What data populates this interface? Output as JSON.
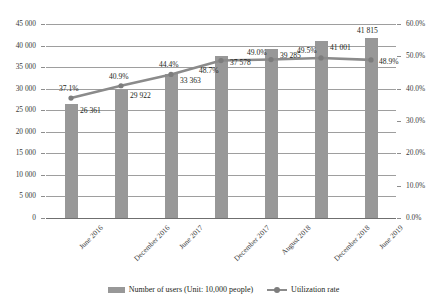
{
  "chart_data": {
    "type": "bar",
    "title": "",
    "subtitle": "",
    "xlabel": "",
    "ylabel": "",
    "grid": true,
    "legend_position": "bottom",
    "categories": [
      "June 2016",
      "December 2016",
      "June 2017",
      "December 2017",
      "August 2018",
      "December 2018",
      "June 2019"
    ],
    "series": [
      {
        "name": "Number of users (Unit: 10,000 people)",
        "type": "bar",
        "axis": "left",
        "color": "#989898",
        "values": [
          26361,
          29922,
          33363,
          37578,
          39285,
          41001,
          41815
        ],
        "value_labels": [
          "26 361",
          "29 922",
          "33 363",
          "37 578",
          "39 285",
          "41 001",
          "41 815"
        ]
      },
      {
        "name": "Utilization rate",
        "type": "line",
        "axis": "right",
        "color": "#8b8b8b",
        "values": [
          37.1,
          40.9,
          44.4,
          48.7,
          49.0,
          49.5,
          48.9
        ],
        "value_labels": [
          "37.1%",
          "40.9%",
          "44.4%",
          "48.7%",
          "49.0%",
          "49.5%",
          "48.9%"
        ]
      }
    ],
    "left_axis": {
      "min": 0,
      "max": 45000,
      "step": 5000,
      "ticks": [
        "0",
        "5 000",
        "10 000",
        "15 000",
        "20 000",
        "25 000",
        "30 000",
        "35 000",
        "40 000",
        "45 000"
      ]
    },
    "right_axis": {
      "min": 0,
      "max": 60,
      "step": 10,
      "ticks": [
        "0.0%",
        "10.0%",
        "20.0%",
        "30.0%",
        "40.0%",
        "50.0%",
        "60.0%"
      ]
    }
  }
}
